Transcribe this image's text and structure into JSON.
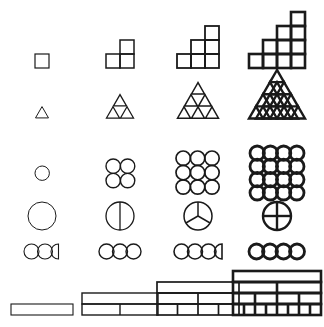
{
  "figure": {
    "background_color": "#ffffff",
    "ink_color": "#111111",
    "columns": 4,
    "rows": 6
  },
  "rows": [
    {
      "name": "staircase-squares",
      "label": "Staircase of unit squares",
      "unit": "square",
      "stages": [
        {
          "index": 1,
          "column_heights": [
            1
          ],
          "count": 1,
          "stroke": 1.2
        },
        {
          "index": 2,
          "column_heights": [
            1,
            2
          ],
          "count": 3,
          "stroke": 1.5
        },
        {
          "index": 3,
          "column_heights": [
            1,
            2,
            3
          ],
          "count": 6,
          "stroke": 1.8
        },
        {
          "index": 4,
          "column_heights": [
            1,
            2,
            3,
            4
          ],
          "count": 10,
          "stroke": 2.6
        }
      ]
    },
    {
      "name": "triangular-number-triangles",
      "label": "Triangular arrangement of unit triangles",
      "unit": "triangle",
      "stages": [
        {
          "index": 1,
          "rows": 1,
          "count": 1,
          "stroke": 1.0,
          "subdivided": false
        },
        {
          "index": 2,
          "rows": 2,
          "count": 3,
          "stroke": 1.3,
          "subdivided": false
        },
        {
          "index": 3,
          "rows": 3,
          "count": 6,
          "stroke": 1.5,
          "subdivided": false
        },
        {
          "index": 4,
          "rows": 4,
          "count": 10,
          "stroke": 2.4,
          "subdivided": true
        }
      ]
    },
    {
      "name": "square-array-of-circles",
      "label": "Square array of circles",
      "unit": "circle",
      "stages": [
        {
          "index": 1,
          "grid": 1,
          "count": 1,
          "stroke": 1.0
        },
        {
          "index": 2,
          "grid": 2,
          "count": 4,
          "stroke": 1.4
        },
        {
          "index": 3,
          "grid": 3,
          "count": 9,
          "stroke": 1.7
        },
        {
          "index": 4,
          "grid": 4,
          "count": 16,
          "stroke": 2.8
        }
      ]
    },
    {
      "name": "partitioned-disc",
      "label": "Disc divided into equal sectors",
      "unit": "sector",
      "stages": [
        {
          "index": 1,
          "sectors": 1,
          "stroke": 1.0
        },
        {
          "index": 2,
          "sectors": 2,
          "stroke": 1.3
        },
        {
          "index": 3,
          "sectors": 3,
          "stroke": 1.5
        },
        {
          "index": 4,
          "sectors": 4,
          "stroke": 2.4
        }
      ]
    },
    {
      "name": "circle-chain-with-fraction",
      "label": "Chain of tangent circles with a trailing half circle",
      "unit": "circle",
      "stages": [
        {
          "index": 1,
          "whole": 2,
          "half": 1,
          "total": 2.5,
          "stroke": 1.1
        },
        {
          "index": 2,
          "whole": 3,
          "half": 0,
          "total": 3.0,
          "stroke": 1.4
        },
        {
          "index": 3,
          "whole": 3,
          "half": 1,
          "total": 3.5,
          "stroke": 1.6
        },
        {
          "index": 4,
          "whole": 4,
          "half": 0,
          "total": 4.0,
          "stroke": 2.8
        }
      ]
    },
    {
      "name": "stacked-fraction-bars",
      "label": "Stacked bars subdivided into equal parts",
      "unit": "bar",
      "stages": [
        {
          "index": 1,
          "bar_rows": [
            1
          ],
          "stroke": 1.1
        },
        {
          "index": 2,
          "bar_rows": [
            1,
            2
          ],
          "stroke": 1.4
        },
        {
          "index": 3,
          "bar_rows": [
            1,
            2,
            4
          ],
          "stroke": 1.7
        },
        {
          "index": 4,
          "bar_rows": [
            1,
            2,
            4,
            8
          ],
          "stroke": 2.6
        }
      ]
    }
  ]
}
